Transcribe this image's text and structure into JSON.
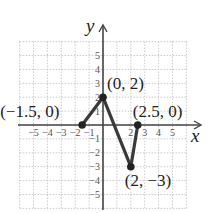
{
  "chart_data": {
    "type": "line",
    "title": "",
    "xlabel": "x",
    "ylabel": "y",
    "xlim": [
      -6,
      6
    ],
    "ylim": [
      -6,
      6
    ],
    "grid": true,
    "x_ticks": [
      "-5",
      "-4",
      "-3",
      "-2",
      "-1",
      "2",
      "3",
      "4",
      "5"
    ],
    "y_ticks": [
      "5",
      "4",
      "3",
      "2",
      "1",
      "-1",
      "-2",
      "-3",
      "-4",
      "-5"
    ],
    "series": [
      {
        "name": "piecewise",
        "points": [
          {
            "x": -1.5,
            "y": 0,
            "label": "(−1.5, 0)"
          },
          {
            "x": 0,
            "y": 2,
            "label": "(0, 2)"
          },
          {
            "x": 2,
            "y": -3,
            "label": "(2, −3)"
          },
          {
            "x": 2.5,
            "y": 0,
            "label": "(2.5, 0)"
          }
        ]
      }
    ],
    "colors": {
      "line": "#3a3a3a",
      "grid": "#bdbdbd",
      "axis": "#444444",
      "point": "#222222"
    }
  }
}
